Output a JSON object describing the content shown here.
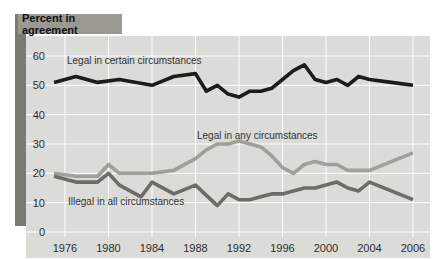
{
  "figure": {
    "title_chip": "Percent in agreement"
  },
  "chart_data": {
    "type": "line",
    "title": "Percent in agreement",
    "xlabel": "",
    "ylabel": "",
    "grid": true,
    "legend_position": "inline-labels",
    "ylim": [
      0,
      66
    ],
    "y_ticks": [
      0,
      10,
      20,
      30,
      40,
      50,
      60
    ],
    "x_tick_years": [
      1976,
      1980,
      1984,
      1988,
      1992,
      1996,
      2000,
      2004,
      2006
    ],
    "x_tick_labels": [
      "1976",
      "1980",
      "1984",
      "1988",
      "1992",
      "1996",
      "2000",
      "2004",
      "2006"
    ],
    "colors": {
      "panel": "#dbdbd8",
      "gridline": "#ffffff",
      "axis_text": "#2e2e2e",
      "label_text": "#333333",
      "accent_bar": "#7b7b73",
      "title_chip_bg": "#9a9a92"
    },
    "series": [
      {
        "name": "Legal in certain circumstances",
        "color": "#1c1c1c",
        "label_pos": [
          67,
          64
        ],
        "points": [
          [
            1975,
            51
          ],
          [
            1977,
            53
          ],
          [
            1979,
            51
          ],
          [
            1981,
            52
          ],
          [
            1984,
            50
          ],
          [
            1986,
            53
          ],
          [
            1988,
            54
          ],
          [
            1989,
            48
          ],
          [
            1990,
            50
          ],
          [
            1991,
            47
          ],
          [
            1992,
            46
          ],
          [
            1993,
            48
          ],
          [
            1994,
            48
          ],
          [
            1995,
            49
          ],
          [
            1996,
            52
          ],
          [
            1997,
            55
          ],
          [
            1998,
            57
          ],
          [
            1999,
            52
          ],
          [
            2000,
            51
          ],
          [
            2001,
            52
          ],
          [
            2002,
            50
          ],
          [
            2003,
            53
          ],
          [
            2004,
            52
          ],
          [
            2005,
            51
          ],
          [
            2006,
            50
          ]
        ]
      },
      {
        "name": "Legal in any circumstances",
        "color": "#a0a099",
        "label_pos": [
          197,
          139
        ],
        "points": [
          [
            1975,
            20
          ],
          [
            1977,
            19
          ],
          [
            1979,
            19
          ],
          [
            1980,
            23
          ],
          [
            1981,
            20
          ],
          [
            1984,
            20
          ],
          [
            1986,
            21
          ],
          [
            1988,
            25
          ],
          [
            1989,
            28
          ],
          [
            1990,
            30
          ],
          [
            1991,
            30
          ],
          [
            1992,
            31
          ],
          [
            1993,
            30
          ],
          [
            1994,
            29
          ],
          [
            1995,
            26
          ],
          [
            1996,
            22
          ],
          [
            1997,
            20
          ],
          [
            1998,
            23
          ],
          [
            1999,
            24
          ],
          [
            2000,
            23
          ],
          [
            2001,
            23
          ],
          [
            2002,
            21
          ],
          [
            2003,
            21
          ],
          [
            2004,
            21
          ],
          [
            2005,
            24
          ],
          [
            2006,
            27
          ]
        ]
      },
      {
        "name": "Illegal in all circumstances",
        "color": "#6d6d66",
        "label_pos": [
          68,
          205
        ],
        "points": [
          [
            1975,
            19
          ],
          [
            1977,
            17
          ],
          [
            1979,
            17
          ],
          [
            1980,
            20
          ],
          [
            1981,
            16
          ],
          [
            1983,
            12
          ],
          [
            1984,
            17
          ],
          [
            1986,
            13
          ],
          [
            1988,
            16
          ],
          [
            1990,
            9
          ],
          [
            1991,
            13
          ],
          [
            1992,
            11
          ],
          [
            1993,
            11
          ],
          [
            1994,
            12
          ],
          [
            1995,
            13
          ],
          [
            1996,
            13
          ],
          [
            1997,
            14
          ],
          [
            1998,
            15
          ],
          [
            1999,
            15
          ],
          [
            2000,
            16
          ],
          [
            2001,
            17
          ],
          [
            2002,
            15
          ],
          [
            2003,
            14
          ],
          [
            2004,
            17
          ],
          [
            2005,
            14
          ],
          [
            2006,
            11
          ]
        ]
      }
    ]
  }
}
